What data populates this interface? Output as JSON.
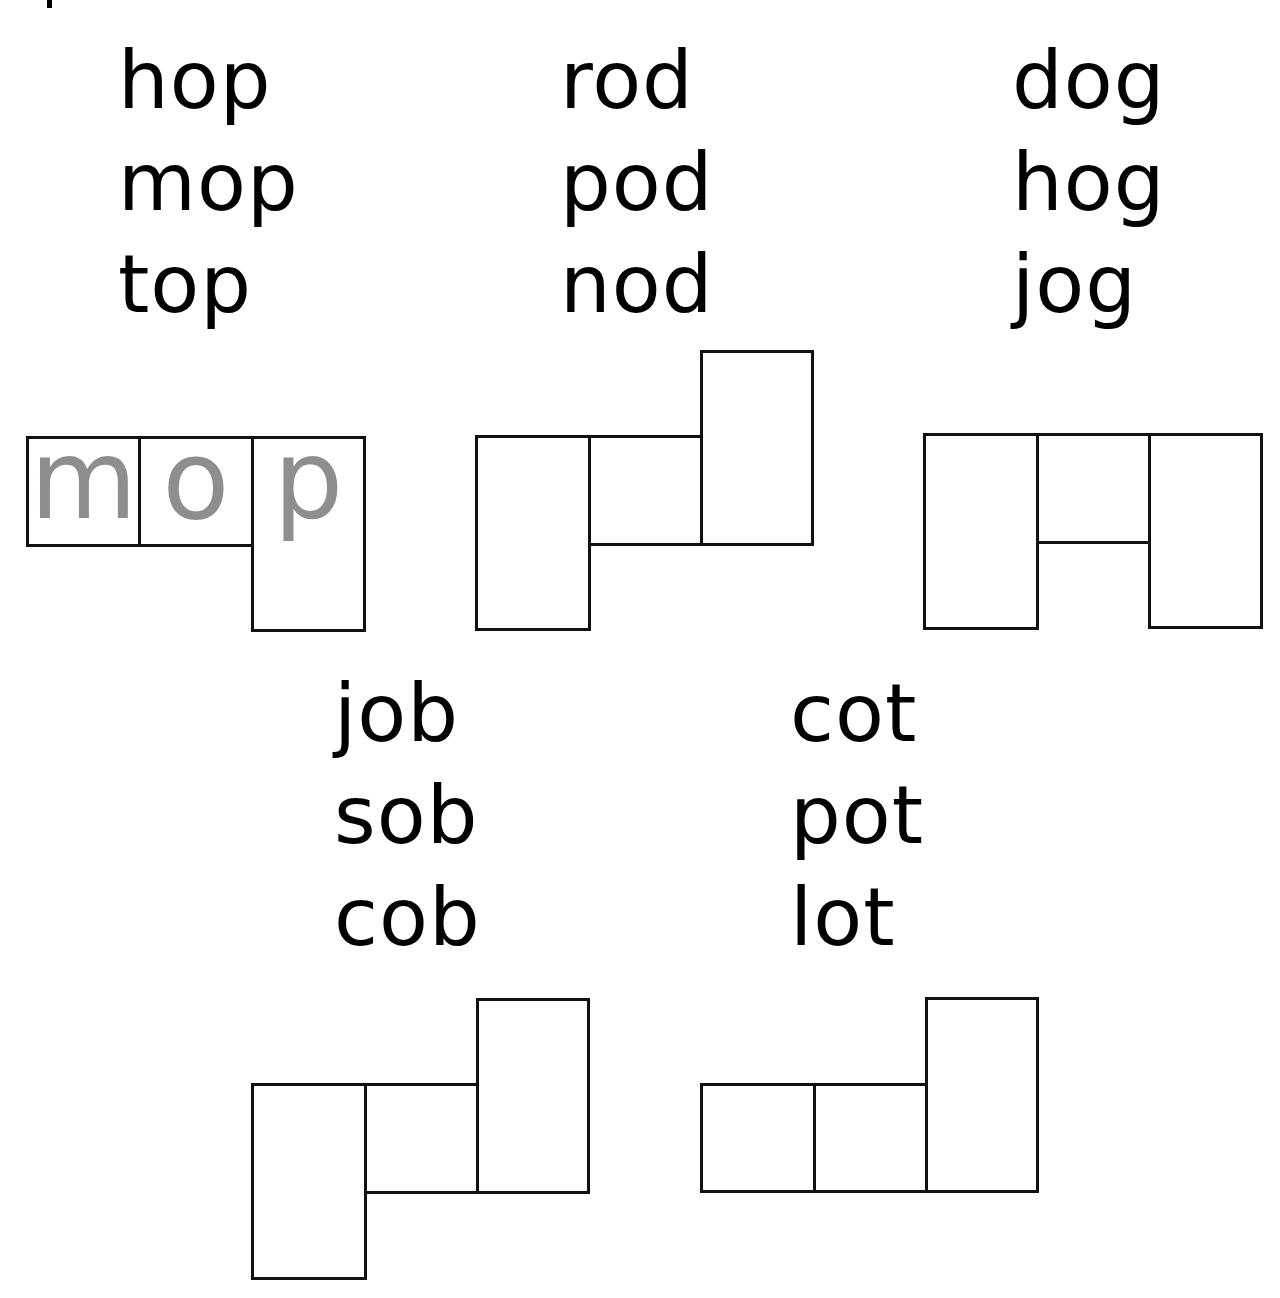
{
  "worksheet": {
    "word_families": [
      {
        "family": "op",
        "words": [
          "hop",
          "mop",
          "top"
        ]
      },
      {
        "family": "od",
        "words": [
          "rod",
          "pod",
          "nod"
        ]
      },
      {
        "family": "og",
        "words": [
          "dog",
          "hog",
          "jog"
        ]
      },
      {
        "family": "ob",
        "words": [
          "job",
          "sob",
          "cob"
        ]
      },
      {
        "family": "ot",
        "words": [
          "cot",
          "pot",
          "lot"
        ]
      }
    ],
    "example": {
      "word": "mop",
      "letters": [
        "m",
        "o",
        "p"
      ],
      "letter_color": "#8e8e8e"
    },
    "box_shapes": [
      {
        "for_family": "op",
        "shape": "short-short-descender"
      },
      {
        "for_family": "od",
        "shape": "descender-short-ascender"
      },
      {
        "for_family": "og",
        "shape": "tall-short-descender"
      },
      {
        "for_family": "ob",
        "shape": "descender-short-ascender"
      },
      {
        "for_family": "ot",
        "shape": "short-short-ascender"
      }
    ]
  }
}
